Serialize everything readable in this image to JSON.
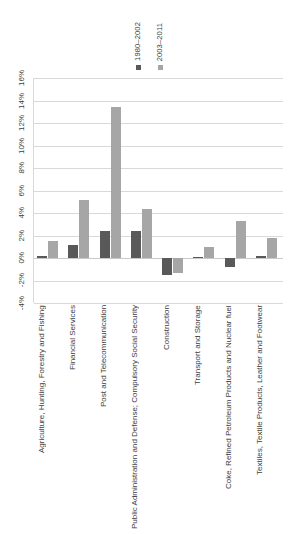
{
  "chart_data": {
    "type": "bar",
    "title": "",
    "subtitle": "",
    "xlabel": "",
    "ylabel": "",
    "ylim": [
      -4,
      16
    ],
    "ytick_labels": [
      "16%",
      "14%",
      "12%",
      "10%",
      "8%",
      "6%",
      "4%",
      "2%",
      "0%",
      "-2%",
      "-4%"
    ],
    "ytick_values": [
      16,
      14,
      12,
      10,
      8,
      6,
      4,
      2,
      0,
      -2,
      -4
    ],
    "grid": true,
    "legend_position": "top",
    "categories": [
      "Agriculture, Hunting, Forestry and Fishing",
      "Financial Services",
      "Post and Telecommunication",
      "Public Administration and Defense; Compulsory Social Security",
      "Construction",
      "Transport and Storage",
      "Coke, Refined Petroleum Products and Nuclear fuel",
      "Textiles, Textile Products, Leather and Footwear"
    ],
    "series": [
      {
        "name": "1980–2002",
        "color": "#595959",
        "values": [
          0.15,
          1.2,
          2.4,
          2.4,
          -1.5,
          0.1,
          -0.8,
          0.15
        ]
      },
      {
        "name": "2003–2011",
        "color": "#a6a6a6",
        "values": [
          1.5,
          5.2,
          13.4,
          4.4,
          -1.3,
          1.0,
          3.3,
          1.8
        ]
      }
    ]
  },
  "legend": {
    "entries": [
      {
        "label": "1980–2002",
        "color": "#595959"
      },
      {
        "label": "2003–2011",
        "color": "#a6a6a6"
      }
    ]
  }
}
